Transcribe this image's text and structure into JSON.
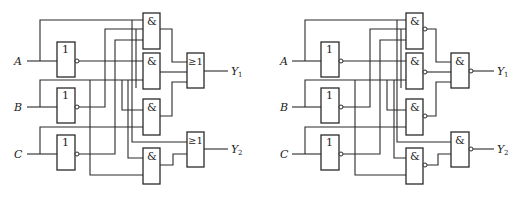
{
  "diagrams": [
    {
      "id": "left",
      "description": "NOT + AND + OR implementation",
      "inputs": [
        {
          "name": "A",
          "label": "A"
        },
        {
          "name": "B",
          "label": "B"
        },
        {
          "name": "C",
          "label": "C"
        }
      ],
      "not_gates": [
        {
          "symbol": "1"
        },
        {
          "symbol": "1"
        },
        {
          "symbol": "1"
        }
      ],
      "and_gates": [
        {
          "symbol": "&"
        },
        {
          "symbol": "&"
        },
        {
          "symbol": "&"
        },
        {
          "symbol": "&"
        }
      ],
      "output_gates": [
        {
          "symbol": "≥1",
          "output": "Y",
          "sub": "1"
        },
        {
          "symbol": "≥1",
          "output": "Y",
          "sub": "2"
        }
      ]
    },
    {
      "id": "right",
      "description": "NOT + NAND + NAND implementation",
      "inputs": [
        {
          "name": "A",
          "label": "A"
        },
        {
          "name": "B",
          "label": "B"
        },
        {
          "name": "C",
          "label": "C"
        }
      ],
      "not_gates": [
        {
          "symbol": "1"
        },
        {
          "symbol": "1"
        },
        {
          "symbol": "1"
        }
      ],
      "and_gates": [
        {
          "symbol": "&"
        },
        {
          "symbol": "&"
        },
        {
          "symbol": "&"
        },
        {
          "symbol": "&"
        }
      ],
      "output_gates": [
        {
          "symbol": "&",
          "output": "Y",
          "sub": "1"
        },
        {
          "symbol": "&",
          "output": "Y",
          "sub": "2"
        }
      ]
    }
  ]
}
